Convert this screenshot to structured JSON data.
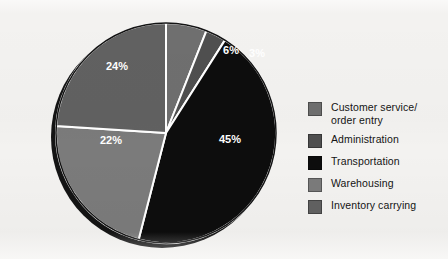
{
  "chart_data": {
    "type": "pie",
    "title": "",
    "subtitle": "",
    "xlabel": "",
    "ylabel": "",
    "legend_position": "right",
    "grid": false,
    "units": "percent",
    "start_angle_deg": 0,
    "direction": "clockwise",
    "categories": [
      "Customer service/order entry",
      "Administration",
      "Transportation",
      "Warehousing",
      "Inventory carrying"
    ],
    "values": [
      6,
      3,
      45,
      22,
      24
    ],
    "data_labels": [
      "6%",
      "3%",
      "45%",
      "22%",
      "24%"
    ],
    "colors": [
      "#6f6f6f",
      "#4f4f4f",
      "#0d0d0d",
      "#7b7b7b",
      "#616161"
    ],
    "slices": [
      {
        "label": "Customer service/order entry",
        "value": 6,
        "data_label": "6%",
        "color": "#6f6f6f",
        "start_deg": 0,
        "end_deg": 21.6,
        "label_x": 182,
        "label_y": 35
      },
      {
        "label": "Administration",
        "value": 3,
        "data_label": "3%",
        "color": "#4f4f4f",
        "start_deg": 21.6,
        "end_deg": 32.4,
        "label_x": 208,
        "label_y": 38
      },
      {
        "label": "Transportation",
        "value": 45,
        "data_label": "45%",
        "color": "#0d0d0d",
        "start_deg": 32.4,
        "end_deg": 194.4,
        "label_x": 181,
        "label_y": 124
      },
      {
        "label": "Warehousing",
        "value": 22,
        "data_label": "22%",
        "color": "#7b7b7b",
        "start_deg": 194.4,
        "end_deg": 273.6,
        "label_x": 62,
        "label_y": 125
      },
      {
        "label": "Inventory carrying",
        "value": 24,
        "data_label": "24%",
        "color": "#616161",
        "start_deg": 273.6,
        "end_deg": 360,
        "label_x": 68,
        "label_y": 51
      }
    ]
  },
  "pie": {
    "center_x": 117,
    "center_y": 117,
    "radius": 110,
    "shadow_offset_x": -4,
    "shadow_offset_y": 4,
    "separator_color": "#ffffff",
    "separator_width": 2,
    "outline_color": "#141414",
    "shadow_color": "#141414"
  },
  "legend": {
    "items": [
      {
        "label": "Customer service/\norder entry",
        "color": "#6f6f6f",
        "swatch_name": "legend-swatch-customer-service"
      },
      {
        "label": "Administration",
        "color": "#4f4f4f",
        "swatch_name": "legend-swatch-administration"
      },
      {
        "label": "Transportation",
        "color": "#0d0d0d",
        "swatch_name": "legend-swatch-transportation"
      },
      {
        "label": "Warehousing",
        "color": "#7b7b7b",
        "swatch_name": "legend-swatch-warehousing"
      },
      {
        "label": "Inventory carrying",
        "color": "#616161",
        "swatch_name": "legend-swatch-inventory-carrying"
      }
    ]
  },
  "page": {
    "background_color": "#f3f2f0",
    "text_color": "#141414",
    "label_text_color": "#ffffff"
  }
}
